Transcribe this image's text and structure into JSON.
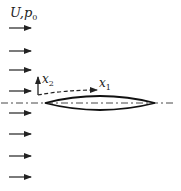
{
  "diagram": {
    "freestream_label": "U,p",
    "freestream_label_sub": "0",
    "axis_x1_label": "x",
    "axis_x1_sub": "1",
    "axis_x2_label": "x",
    "axis_x2_sub": "2",
    "freestream_arrow_count": 8,
    "freestream_arrow_y": [
      28,
      51,
      70,
      91,
      113,
      134,
      156,
      177
    ],
    "body": "thin symmetric lens-shaped airfoil on dash-dot centerline",
    "colors": {
      "line": "#222222",
      "background": "#ffffff"
    }
  }
}
